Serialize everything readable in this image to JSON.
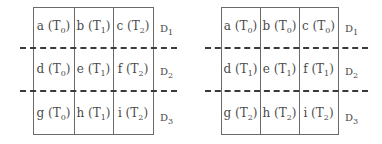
{
  "diagrams": [
    {
      "name": "left",
      "rows": [
        {
          "label": "D",
          "label_sub": "1",
          "cells": [
            {
              "letter": "a",
              "t": "0"
            },
            {
              "letter": "b",
              "t": "1"
            },
            {
              "letter": "c",
              "t": "2"
            }
          ]
        },
        {
          "label": "D",
          "label_sub": "2",
          "cells": [
            {
              "letter": "d",
              "t": "0"
            },
            {
              "letter": "e",
              "t": "1"
            },
            {
              "letter": "f",
              "t": "2"
            }
          ]
        },
        {
          "label": "D",
          "label_sub": "3",
          "cells": [
            {
              "letter": "g",
              "t": "0"
            },
            {
              "letter": "h",
              "t": "1"
            },
            {
              "letter": "i",
              "t": "2"
            }
          ]
        }
      ]
    },
    {
      "name": "right",
      "rows": [
        {
          "label": "D",
          "label_sub": "1",
          "cells": [
            {
              "letter": "a",
              "t": "0"
            },
            {
              "letter": "b",
              "t": "0"
            },
            {
              "letter": "c",
              "t": "0"
            }
          ]
        },
        {
          "label": "D",
          "label_sub": "2",
          "cells": [
            {
              "letter": "d",
              "t": "1"
            },
            {
              "letter": "e",
              "t": "1"
            },
            {
              "letter": "f",
              "t": "1"
            }
          ]
        },
        {
          "label": "D",
          "label_sub": "3",
          "cells": [
            {
              "letter": "g",
              "t": "2"
            },
            {
              "letter": "h",
              "t": "2"
            },
            {
              "letter": "i",
              "t": "2"
            }
          ]
        }
      ]
    }
  ],
  "cell_prefix": "T"
}
